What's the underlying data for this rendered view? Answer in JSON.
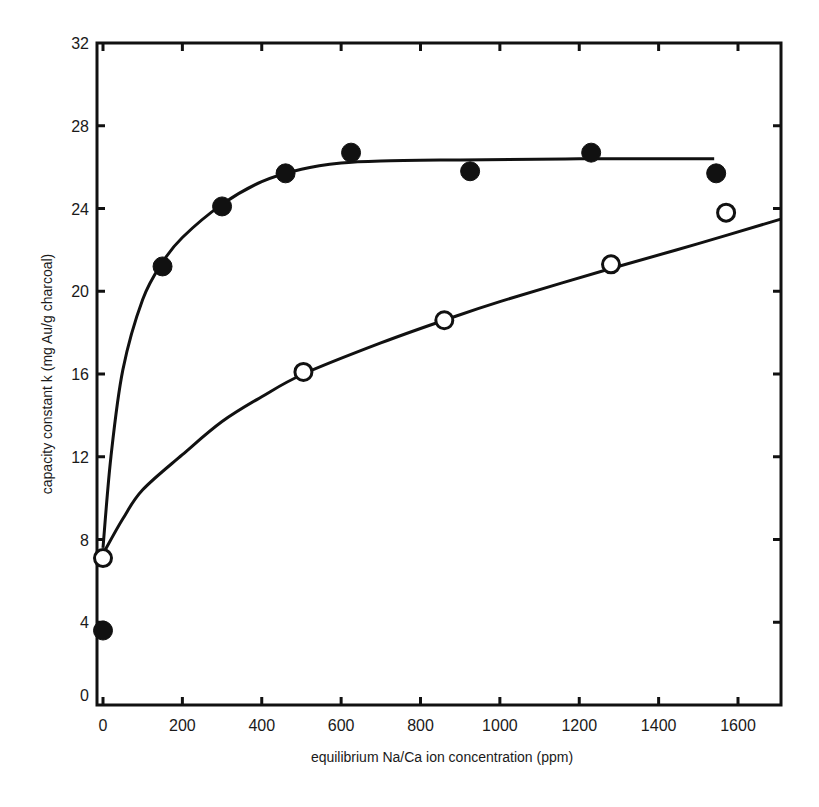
{
  "chart_data": {
    "type": "scatter",
    "title": "",
    "xlabel": "equilibrium Na/Ca ion concentration (ppm)",
    "ylabel": "capacity constant k (mg Au/g charcoal)",
    "xlim": [
      0,
      1710
    ],
    "ylim": [
      0,
      32
    ],
    "x_ticks": [
      0,
      200,
      400,
      600,
      800,
      1000,
      1200,
      1400,
      1600
    ],
    "y_ticks": [
      0,
      4,
      8,
      12,
      16,
      20,
      24,
      28,
      32
    ],
    "grid": false,
    "legend": null,
    "series": [
      {
        "name": "filled circles",
        "marker": "filled-circle",
        "x": [
          0,
          150,
          300,
          460,
          625,
          925,
          1230,
          1545
        ],
        "y": [
          3.6,
          21.2,
          24.1,
          25.7,
          26.7,
          25.8,
          26.7,
          25.7
        ],
        "fit_curve": {
          "x": [
            0,
            20,
            50,
            100,
            150,
            200,
            300,
            400,
            500,
            600,
            700,
            900,
            1200,
            1540
          ],
          "y": [
            7.6,
            12.0,
            16.2,
            19.6,
            21.4,
            22.6,
            24.2,
            25.3,
            25.9,
            26.2,
            26.3,
            26.35,
            26.4,
            26.4
          ]
        }
      },
      {
        "name": "open circles",
        "marker": "open-circle",
        "x": [
          0,
          505,
          860,
          1280,
          1570
        ],
        "y": [
          7.1,
          16.1,
          18.6,
          21.3,
          23.8
        ],
        "fit_curve": {
          "x": [
            0,
            50,
            100,
            200,
            300,
            400,
            505,
            700,
            860,
            1000,
            1280,
            1500,
            1710
          ],
          "y": [
            7.3,
            9.0,
            10.4,
            12.1,
            13.7,
            14.9,
            16.0,
            17.5,
            18.6,
            19.5,
            21.1,
            22.3,
            23.5
          ]
        }
      }
    ]
  },
  "labels": {
    "xlabel": "equilibrium Na/Ca ion concentration (ppm)",
    "ylabel": "capacity constant k (mg Au/g charcoal)"
  }
}
